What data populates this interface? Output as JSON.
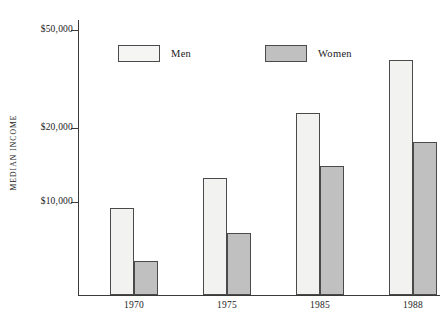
{
  "chart_data": {
    "type": "bar",
    "title": "",
    "xlabel": "",
    "ylabel": "MEDIAN INCOME",
    "categories": [
      "1970",
      "1975",
      "1985",
      "1988"
    ],
    "series": [
      {
        "name": "Men",
        "values": [
          9500,
          12500,
          23000,
          38000
        ],
        "color": "#f2f2f0"
      },
      {
        "name": "Women",
        "values": [
          5800,
          7500,
          14000,
          17500
        ],
        "color": "#c0c0c0"
      }
    ],
    "y_scale": "log",
    "ylim": [
      4200,
      55000
    ],
    "y_ticks": [
      10000,
      20000,
      50000
    ],
    "y_tick_labels": [
      "$10,000",
      "$20,000",
      "$50,000"
    ],
    "grid": false,
    "legend_position": "top-center"
  },
  "legend": {
    "items": [
      {
        "label": "Men"
      },
      {
        "label": "Women"
      }
    ]
  }
}
